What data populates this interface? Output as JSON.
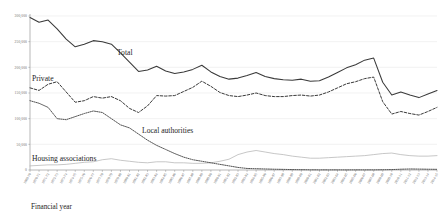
{
  "chart_data": {
    "type": "line",
    "title": "",
    "xlabel": "Financial year",
    "ylabel": "",
    "ylim": [
      0,
      300000
    ],
    "grid": true,
    "legend_position": "inline-annotations",
    "ytick_labels": [
      "300,000",
      "250,000",
      "200,000",
      "150,000",
      "100,000",
      "50,000",
      "0"
    ],
    "ytick_values": [
      300000,
      250000,
      200000,
      150000,
      100000,
      50000,
      0
    ],
    "categories": [
      "1969-70",
      "1970-71",
      "1971-72",
      "1972-73",
      "1973-74",
      "1974-75",
      "1975-76",
      "1976-77",
      "1977-78",
      "1978-79",
      "1979-80",
      "1980-81",
      "1981-82",
      "1982-83",
      "1983-84",
      "1984-85",
      "1985-86",
      "1986-87",
      "1987-88",
      "1988-89",
      "1989-90",
      "1990-91",
      "1991-92",
      "1992-93",
      "1993-94",
      "1994-95",
      "1995-96",
      "1996-97",
      "1997-98",
      "1998-99",
      "1999-00",
      "2000-01",
      "2001-02",
      "2002-03",
      "2003-04",
      "2004-05",
      "2005-06",
      "2006-07",
      "2007-08",
      "2008-09",
      "2009-10",
      "2010-11",
      "2011-12",
      "2012-13",
      "2013-14",
      "2014-15"
    ],
    "series": [
      {
        "name": "Total",
        "style": "solid",
        "color": "#3a3a3a",
        "annotation": "Total",
        "values": [
          297000,
          288000,
          292000,
          275000,
          255000,
          240000,
          245000,
          252000,
          250000,
          245000,
          228000,
          210000,
          192000,
          195000,
          202000,
          193000,
          188000,
          191000,
          196000,
          204000,
          191000,
          182000,
          177000,
          179000,
          184000,
          190000,
          182000,
          178000,
          176000,
          175000,
          177000,
          173000,
          174000,
          181000,
          190000,
          199000,
          205000,
          214000,
          218000,
          171000,
          146000,
          152000,
          146000,
          141000,
          148000,
          155000
        ]
      },
      {
        "name": "Private",
        "style": "dashed",
        "color": "#3a3a3a",
        "annotation": "Private",
        "values": [
          160000,
          155000,
          167000,
          172000,
          152000,
          132000,
          135000,
          143000,
          140000,
          143000,
          135000,
          120000,
          112000,
          125000,
          145000,
          144000,
          145000,
          153000,
          161000,
          173000,
          163000,
          151000,
          145000,
          143000,
          146000,
          150000,
          145000,
          143000,
          143000,
          145000,
          146000,
          144000,
          146000,
          152000,
          160000,
          168000,
          172000,
          178000,
          181000,
          133000,
          109000,
          114000,
          110000,
          107000,
          114000,
          122000
        ]
      },
      {
        "name": "Local authorities",
        "style": "dotted",
        "color": "#4a4a4a",
        "annotation": "Local authorities",
        "values": [
          135000,
          130000,
          122000,
          100000,
          98000,
          104000,
          110000,
          115000,
          112000,
          100000,
          88000,
          82000,
          70000,
          58000,
          48000,
          40000,
          32000,
          25000,
          20000,
          17000,
          14000,
          11000,
          8000,
          5000,
          3000,
          2500,
          2000,
          1500,
          1200,
          800,
          600,
          400,
          300,
          300,
          300,
          200,
          300,
          300,
          300,
          500,
          800,
          1500,
          2000,
          1800,
          1500,
          1300
        ]
      },
      {
        "name": "Housing associations",
        "style": "thin-solid",
        "color": "#b4b4b4",
        "annotation": "Housing associations",
        "values": [
          8000,
          9000,
          10000,
          10000,
          11000,
          13000,
          15000,
          16000,
          20000,
          22000,
          19000,
          17000,
          15000,
          14000,
          16000,
          16000,
          14000,
          14000,
          13000,
          13000,
          14000,
          17000,
          21000,
          30000,
          35000,
          38000,
          35000,
          32000,
          30000,
          27000,
          25000,
          23000,
          23000,
          24000,
          25000,
          26000,
          27000,
          28000,
          30000,
          32000,
          33000,
          30000,
          28000,
          27000,
          27000,
          28000
        ]
      }
    ]
  },
  "annotations": {
    "total": "Total",
    "private": "Private",
    "local_authorities": "Local authorities",
    "housing_associations": "Housing associations",
    "x_axis_title": "Financial year"
  }
}
